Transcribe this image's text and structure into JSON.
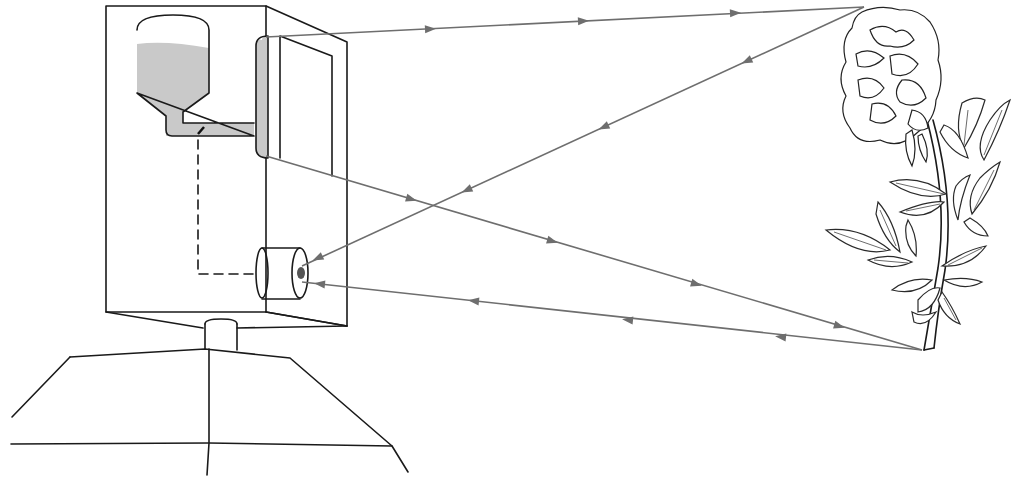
{
  "diagram": {
    "components": [
      {
        "id": "stand",
        "label": "Tripod/stand base"
      },
      {
        "id": "box",
        "label": "Camera body (box)"
      },
      {
        "id": "reservoir",
        "label": "Liquid reservoir bottle"
      },
      {
        "id": "pipe",
        "label": "Feed pipe with valve"
      },
      {
        "id": "lens",
        "label": "Fluid-filled lens panel"
      },
      {
        "id": "eyepiece",
        "label": "Cylindrical eyepiece / sensor"
      },
      {
        "id": "linkage",
        "label": "Dashed control linkage"
      },
      {
        "id": "flower",
        "label": "Flower (peony) subject"
      }
    ],
    "rays": [
      {
        "from": "lens-top",
        "to": "flower-top",
        "direction": "outward"
      },
      {
        "from": "flower-top",
        "to": "eyepiece",
        "direction": "inward"
      },
      {
        "from": "lens-bottom",
        "to": "flower-base",
        "direction": "outward"
      },
      {
        "from": "flower-base",
        "to": "eyepiece",
        "direction": "inward"
      }
    ],
    "colors": {
      "ink": "#1a1a1a",
      "ray": "#6e6e6e",
      "liquid": "#c9c9c9",
      "background": "#ffffff"
    }
  }
}
